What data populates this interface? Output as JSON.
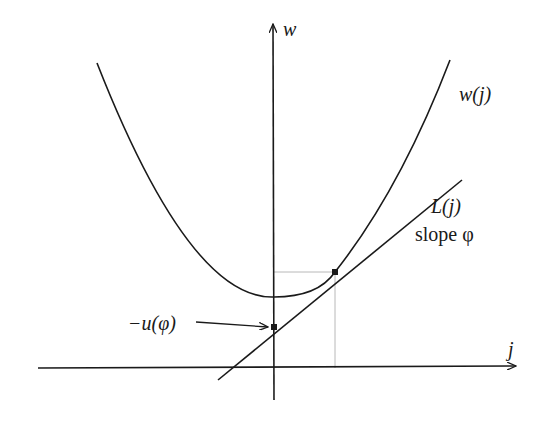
{
  "diagram": {
    "type": "convex function with tangent line (Legendre transform illustration)",
    "axes": {
      "vertical_label": "w",
      "horizontal_label": "j"
    },
    "curve": {
      "label": "w(j)",
      "shape": "convex parabola"
    },
    "tangent_line": {
      "label": "L(j)",
      "slope_label": "slope φ"
    },
    "intercept": {
      "label": "−u(φ)"
    },
    "colors": {
      "ink": "#1a1a1a",
      "guide": "#b8b8b8",
      "background": "#ffffff"
    }
  }
}
